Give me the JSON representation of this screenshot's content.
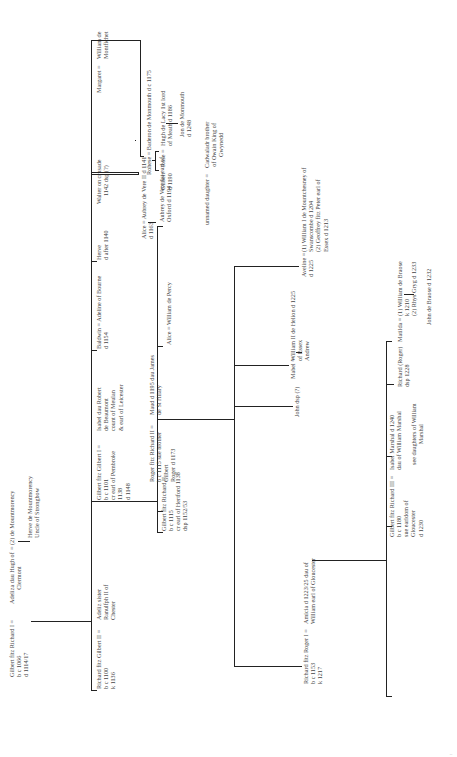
{
  "diagram": {
    "type": "family-tree",
    "orientation": "rotated-90-ccw",
    "generation1": {
      "head": {
        "name": "Gilbert fitz Richard I",
        "spouse1": "Adeliza dau Hugh of\nClermont",
        "spouse2": "(2) de Mountmorency",
        "details": "b c 1066\nd 1114/17"
      },
      "half_sibling": {
        "text": "Herve de Mountmorency\nUncle of Strongbow"
      }
    },
    "generation2": [
      {
        "name": "Richard fitz Gilbert II",
        "spouse": "Adeliz sister\nRanulfph II of\nChester",
        "details": "b c 1100\nk 1136"
      },
      {
        "name": "Gilbert fitz Gilbert I",
        "spouse": "Isabel dau Robert\nde Beaumont\ncount of Meulan\n& earl of Leicester",
        "details": "b c 1101\ncr earl of Pembroke\n1138\nd 1148"
      },
      {
        "name": "Baldwin",
        "spouse": "Adeline of Bourne",
        "details": "d 1154"
      },
      {
        "name": "Herve",
        "details": "d after 1140"
      },
      {
        "name": "Walter on crusade",
        "details": "1142 dsp (?)"
      },
      {
        "name": "Margaret",
        "spouse": "William de\nMontfichet"
      }
    ],
    "margaret_branch": {
      "rohese": {
        "name": "Rohese",
        "spouse": "Baderon de Monmouth d c 1175"
      },
      "gilbert": {
        "text": "Gilbert\nd 1190"
      },
      "rose": {
        "name": "Rose",
        "spouse": "Hugh de Lacy 1st lord\nof Meath d 1186"
      },
      "jon": {
        "text": "Jon de Monmouth\nd 1248"
      }
    },
    "walter_branch": {
      "alice": {
        "name": "Alice",
        "spouse": "Aubrey de Vere II d 1141",
        "details": "d 1163"
      },
      "aubrey": {
        "text": "Aubrey de Vere 1st earl of\nOxford d 1194"
      }
    },
    "generation3": [
      {
        "name": "Gilbert fitz Richard II",
        "details": "b c 1115\ncr earl of Hertford 1138\ndsp 1152/53"
      },
      {
        "name": "Roger fitz Richard II",
        "spouse": "Maud d 1195 dau James\nde St Hilary",
        "details": "b c 1115 sue brother\nGilbert\nRoger d 1173"
      },
      {
        "name": "Alice",
        "spouse": "William de Percy"
      },
      {
        "name": "unnamed daughter",
        "spouse": "Cadwaladr brother\nof Owain King of\nGwynedd"
      }
    ],
    "generation4": [
      {
        "name": "Richard fitz Roger I",
        "spouse": "Amicia d 1223/25 dau of\nWilliam earl of Gloucester",
        "details": "b c 1153\nk 1217"
      },
      {
        "name": "John dsp (?)"
      },
      {
        "name": "Mabel",
        "spouse": "William II de Helion d 1225\nof Essex",
        "child": "Andrew"
      },
      {
        "name": "Aveline",
        "spouse": "(1) William I de Mountchesney of\nSwanscombe d 1204\n(2) Geoffrey fitz Peter earl of\nEssex d 1213",
        "details": "d 1225"
      }
    ],
    "generation5": [
      {
        "name": "Gilbert fitz Richard III",
        "spouse": "Isabel Marshal d 1240\ndau of William Marshal",
        "details": "b c 1180\nsue earldom of\nGloucester\nd 1230",
        "note": "see daughters of William\nMarshal"
      },
      {
        "name": "Richard (Roger)",
        "details": "dsp 1228"
      },
      {
        "name": "Matilda",
        "spouse": "(1) William de Braose\nk 1210\n(2) Rhys Gryg d 1233",
        "child": "John de Braose d 1232"
      }
    ],
    "page_marker": ":"
  }
}
